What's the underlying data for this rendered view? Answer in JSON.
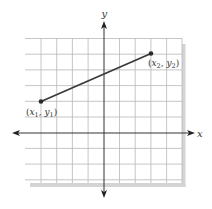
{
  "figure": {
    "axes": {
      "x_label": "x",
      "y_label": "y"
    },
    "points": [
      {
        "id": "p1",
        "label_main": "(x",
        "sub1": "1",
        "mid": ", y",
        "sub2": "1",
        "close": ")",
        "grid_x": -4,
        "grid_y": 2
      },
      {
        "id": "p2",
        "label_main": "(x",
        "sub1": "2",
        "mid": ", y",
        "sub2": "2",
        "close": ")",
        "grid_x": 3,
        "grid_y": 5
      }
    ],
    "grid": {
      "x_range": [
        -5,
        5
      ],
      "y_range": [
        -3,
        6
      ],
      "spacing_px": 15.7
    },
    "colors": {
      "grid": "#b5b5b5",
      "axis": "#333333",
      "segment": "#3a3a3a",
      "shadow": "#d4d4d4",
      "text": "#333333"
    }
  }
}
